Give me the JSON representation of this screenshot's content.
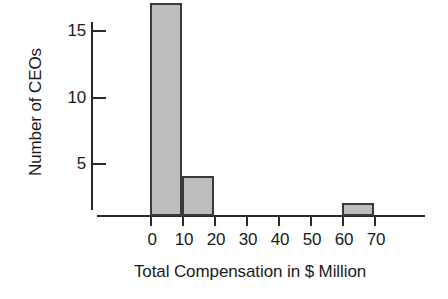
{
  "chart_data": {
    "type": "bar",
    "title": "",
    "subtitle": "",
    "xlabel": "Total Compensation in $ Million",
    "ylabel": "Number of CEOs",
    "bin_edges": [
      0,
      10,
      20,
      30,
      40,
      50,
      60,
      70
    ],
    "categories": [
      "0-10",
      "10-20",
      "20-30",
      "30-40",
      "40-50",
      "50-60",
      "60-70"
    ],
    "values": [
      16,
      3,
      0,
      0,
      0,
      0,
      1
    ],
    "bars": [
      {
        "label": "0-10",
        "x0": 0,
        "x1": 10,
        "value": 16
      },
      {
        "label": "10-20",
        "x0": 10,
        "x1": 20,
        "value": 3
      },
      {
        "label": "20-30",
        "x0": 20,
        "x1": 30,
        "value": 0
      },
      {
        "label": "30-40",
        "x0": 30,
        "x1": 40,
        "value": 0
      },
      {
        "label": "40-50",
        "x0": 40,
        "x1": 50,
        "value": 0
      },
      {
        "label": "50-60",
        "x0": 50,
        "x1": 60,
        "value": 0
      },
      {
        "label": "60-70",
        "x0": 60,
        "x1": 70,
        "value": 1
      }
    ],
    "xlim": [
      0,
      70
    ],
    "ylim": [
      0,
      17
    ],
    "xticks": [
      0,
      10,
      20,
      30,
      40,
      50,
      60,
      70
    ],
    "xtick_labels": [
      "0",
      "10",
      "20",
      "30",
      "40",
      "50",
      "60",
      "70"
    ],
    "yticks": [
      5,
      10,
      15
    ],
    "ytick_labels": [
      "5",
      "10",
      "15"
    ],
    "grid": false,
    "legend": null,
    "legend_position": "none",
    "colors": {
      "bar_fill": "#bdbdbd",
      "bar_edge": "#3a3a3a",
      "axis": "#2a2a2a",
      "text": "#1a1a1a",
      "background": "#ffffff"
    }
  }
}
